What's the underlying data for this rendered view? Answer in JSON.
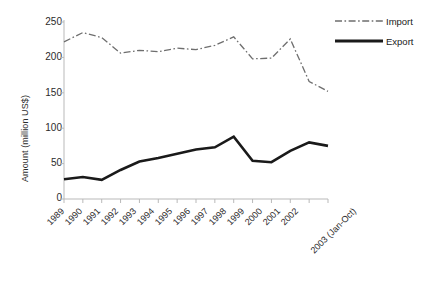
{
  "chart_data": {
    "type": "line",
    "title": "",
    "xlabel": "",
    "ylabel": "Amount (million US$)",
    "ylim": [
      0,
      250
    ],
    "yticks": [
      0,
      50,
      100,
      150,
      200,
      250
    ],
    "grid": false,
    "legend_position": "top-right",
    "categories": [
      "1989",
      "1990",
      "1991",
      "1992",
      "1993",
      "1994",
      "1995",
      "1996",
      "1997",
      "1998",
      "1999",
      "2000",
      "2001",
      "2002",
      "2003 (Jan-Oct)"
    ],
    "series": [
      {
        "name": "Import",
        "style": "dash-dot",
        "color": "#6e6e6e",
        "values": [
          222,
          235,
          228,
          206,
          210,
          208,
          213,
          211,
          217,
          229,
          198,
          199,
          226,
          166,
          152
        ]
      },
      {
        "name": "Export",
        "style": "solid",
        "color": "#1a1a1a",
        "values": [
          28,
          31,
          27,
          41,
          53,
          58,
          64,
          70,
          73,
          88,
          54,
          52,
          68,
          80,
          75
        ]
      }
    ]
  },
  "legend": {
    "items": [
      {
        "label": "Import"
      },
      {
        "label": "Export"
      }
    ]
  },
  "axes": {
    "y_title": "Amount (million US$)",
    "y_tick_labels": [
      "0",
      "50",
      "100",
      "150",
      "200",
      "250"
    ],
    "x_tick_labels": [
      "1989",
      "1990",
      "1991",
      "1992",
      "1993",
      "1994",
      "1995",
      "1996",
      "1997",
      "1998",
      "1999",
      "2000",
      "2001",
      "2002",
      "2003 (Jan-Oct)"
    ]
  }
}
